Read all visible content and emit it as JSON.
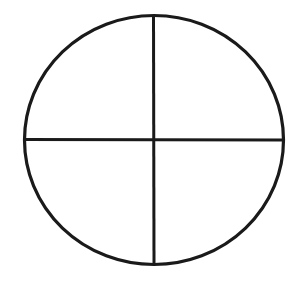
{
  "diagram": {
    "stroke_color": "#1a1a1a",
    "background": "#ffffff",
    "circle": {
      "cx": 154,
      "cy": 140,
      "rx": 129.5,
      "ry": 124.5
    },
    "vertical_line": {
      "x1": 153.5,
      "y1": 15.5,
      "x2": 154,
      "y2": 264.5
    },
    "horizontal_line": {
      "x1": 24.5,
      "y1": 139.5,
      "x2": 283.5,
      "y2": 140
    },
    "quadrants": [
      "top-left",
      "top-right",
      "bottom-left",
      "bottom-right"
    ]
  }
}
